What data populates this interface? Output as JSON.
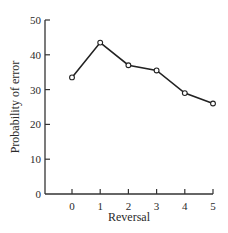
{
  "chart_data": {
    "type": "line",
    "title": "",
    "xlabel": "Reversal",
    "ylabel": "Probability of error",
    "categories": [
      "0",
      "1",
      "2",
      "3",
      "4",
      "5"
    ],
    "x": [
      0,
      1,
      2,
      3,
      4,
      5
    ],
    "series": [
      {
        "name": "Probability of error",
        "values": [
          33.5,
          43.5,
          37,
          35.5,
          29,
          26
        ],
        "marker": "open-circle"
      }
    ],
    "ylim": [
      0,
      50
    ],
    "yticks": [
      0,
      10,
      20,
      30,
      40,
      50
    ],
    "xticks": [
      0,
      1,
      2,
      3,
      4,
      5
    ],
    "grid": false,
    "legend": "none",
    "colors": {
      "line": "#222222",
      "axis": "#333333",
      "marker_fill": "#ffffff"
    }
  }
}
